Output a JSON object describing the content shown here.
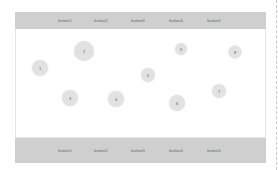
{
  "top_bar": {
    "buttons": [
      {
        "label": "button1",
        "x": 65
      },
      {
        "label": "button2",
        "x": 101
      },
      {
        "label": "button3",
        "x": 138
      },
      {
        "label": "button4",
        "x": 176
      },
      {
        "label": "button5",
        "x": 214
      }
    ]
  },
  "bottom_bar": {
    "buttons": [
      {
        "label": "button1",
        "x": 65
      },
      {
        "label": "button2",
        "x": 101
      },
      {
        "label": "button3",
        "x": 138
      },
      {
        "label": "button4",
        "x": 176
      },
      {
        "label": "button5",
        "x": 214
      }
    ]
  },
  "nodes": [
    {
      "label": "1",
      "x": 40,
      "y": 68,
      "size": 16
    },
    {
      "label": "2",
      "x": 84,
      "y": 51,
      "size": 20
    },
    {
      "label": "3",
      "x": 70,
      "y": 98,
      "size": 16
    },
    {
      "label": "4",
      "x": 116,
      "y": 99,
      "size": 16
    },
    {
      "label": "5",
      "x": 148,
      "y": 75,
      "size": 14
    },
    {
      "label": "6",
      "x": 177,
      "y": 103,
      "size": 16
    },
    {
      "label": "7",
      "x": 219,
      "y": 91,
      "size": 14
    },
    {
      "label": "8",
      "x": 235,
      "y": 52,
      "size": 13
    },
    {
      "label": "9",
      "x": 181,
      "y": 49,
      "size": 12
    }
  ]
}
